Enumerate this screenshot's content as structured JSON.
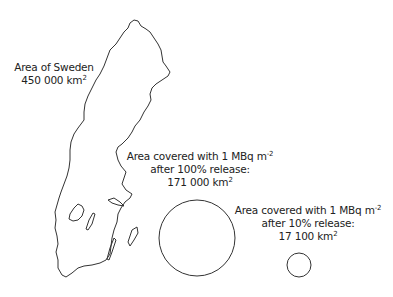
{
  "labels": {
    "sweden": {
      "line1": "Area of Sweden",
      "value": "450 000 km",
      "sup": "2"
    },
    "release100": {
      "line1": "Area covered with 1 MBq m",
      "line1_sup": "-2",
      "line2": "after 100% release:",
      "value": "171 000 km",
      "sup": "2"
    },
    "release10": {
      "line1": "Area covered with 1 MBq m",
      "line1_sup": "-2",
      "line2": "after 10% release:",
      "value": "17 100 km",
      "sup": "2"
    }
  },
  "shapes": {
    "sweden_area_km2": 450000,
    "circle_100_area_km2": 171000,
    "circle_10_area_km2": 17100,
    "stroke_color": "#333333"
  }
}
